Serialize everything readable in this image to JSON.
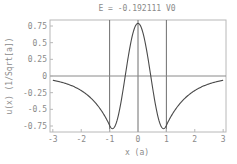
{
  "chart_data": {
    "type": "line",
    "title": "E = -0.192111  V0",
    "xlabel": "x (a)",
    "ylabel": "u(x) (1/Sqrt[a])",
    "xlim": [
      -3.1,
      3.1
    ],
    "ylim": [
      -0.84,
      0.84
    ],
    "xticks": [
      -3,
      -2,
      -1,
      0,
      1,
      2,
      3
    ],
    "xtick_labels": [
      "-3",
      "-2",
      "-1",
      "0",
      "1",
      "2",
      "3"
    ],
    "yticks": [
      0.75,
      0.5,
      0.25,
      0,
      -0.25,
      -0.5,
      -0.75
    ],
    "ytick_labels": [
      "0.75",
      "0.5",
      "0.25",
      "0",
      "-0.25",
      "-0.5",
      "-0.75"
    ],
    "grid": false,
    "reference_lines": {
      "vertical": [
        -1,
        0,
        1
      ],
      "horizontal": [
        0
      ]
    },
    "series": [
      {
        "name": "u(x)",
        "x": [
          -3,
          -2.5,
          -2,
          -1.5,
          -1,
          -0.9,
          -0.75,
          -0.5,
          -0.45,
          -0.25,
          0,
          0.25,
          0.45,
          0.5,
          0.75,
          0.9,
          1,
          1.5,
          2,
          2.5,
          3
        ],
        "values": [
          -0.04,
          -0.11,
          -0.22,
          -0.45,
          -0.74,
          -0.79,
          -0.68,
          -0.04,
          0,
          0.51,
          0.79,
          0.51,
          0,
          -0.04,
          -0.68,
          -0.79,
          -0.74,
          -0.45,
          -0.22,
          -0.11,
          -0.04
        ]
      }
    ]
  }
}
